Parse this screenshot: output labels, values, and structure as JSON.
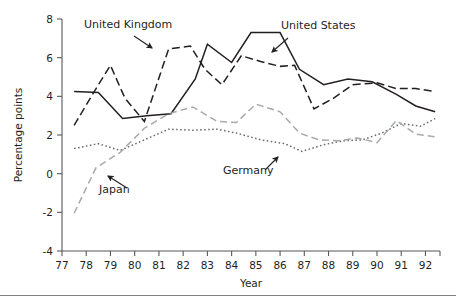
{
  "chart_data": {
    "type": "line",
    "title": "",
    "xlabel": "Year",
    "ylabel": "Percentage points",
    "xlim": [
      77,
      92.6
    ],
    "ylim": [
      -4,
      8
    ],
    "grid": false,
    "legend_position": "inline-annotations",
    "xticks": [
      "77",
      "78",
      "79",
      "80",
      "81",
      "82",
      "83",
      "84",
      "85",
      "86",
      "87",
      "88",
      "89",
      "90",
      "91",
      "92"
    ],
    "yticks": [
      "-4",
      "-2",
      "0",
      "2",
      "4",
      "6",
      "8"
    ],
    "x": [
      77.5,
      78,
      79,
      80,
      81,
      82,
      82.5,
      83,
      84,
      85,
      86,
      86.5,
      87,
      88,
      89,
      90,
      91,
      92,
      92.5
    ],
    "series": [
      {
        "name": "United States",
        "style": "solid",
        "color": "#231f20",
        "x": [
          77.5,
          78.5,
          79.5,
          80.5,
          81.5,
          82.5,
          83.0,
          84.0,
          84.8,
          86.0,
          86.8,
          87.8,
          88.8,
          89.8,
          90.8,
          91.6,
          92.4
        ],
        "values": [
          4.25,
          4.2,
          2.85,
          3.0,
          3.1,
          4.9,
          6.7,
          5.75,
          7.3,
          7.3,
          5.4,
          4.6,
          4.9,
          4.75,
          4.1,
          3.5,
          3.2
        ]
      },
      {
        "name": "United Kingdom",
        "style": "dashed",
        "color": "#231f20",
        "x": [
          77.5,
          78.5,
          79.0,
          79.6,
          80.4,
          81.4,
          82.3,
          82.9,
          83.6,
          84.4,
          85.2,
          86.0,
          86.6,
          87.4,
          88.2,
          89.0,
          90.0,
          90.8,
          91.6,
          92.4
        ],
        "values": [
          2.5,
          4.6,
          5.6,
          3.9,
          2.7,
          6.45,
          6.6,
          5.4,
          4.6,
          6.1,
          5.8,
          5.55,
          5.6,
          3.35,
          3.9,
          4.6,
          4.7,
          4.4,
          4.4,
          4.25
        ]
      },
      {
        "name": "Germany",
        "style": "dotted",
        "color": "#6d6e71",
        "x": [
          77.5,
          78.5,
          79.4,
          80.4,
          81.4,
          82.4,
          83.4,
          84.2,
          85.2,
          86.2,
          86.9,
          87.8,
          88.6,
          89.4,
          90.2,
          91.0,
          91.8,
          92.4
        ],
        "values": [
          1.3,
          1.55,
          1.2,
          1.75,
          2.3,
          2.25,
          2.3,
          2.1,
          1.75,
          1.55,
          1.15,
          1.5,
          1.7,
          1.75,
          2.1,
          2.6,
          2.45,
          2.85
        ]
      },
      {
        "name": "Japan",
        "style": "dashed-light",
        "color": "#a7a9ac",
        "x": [
          77.5,
          78.4,
          79.4,
          80.4,
          81.4,
          82.4,
          83.4,
          84.2,
          85.0,
          86.0,
          86.8,
          87.6,
          88.4,
          89.2,
          90.0,
          90.8,
          91.6,
          92.4
        ],
        "values": [
          -2.05,
          0.3,
          1.1,
          2.35,
          3.1,
          3.45,
          2.7,
          2.65,
          3.6,
          3.2,
          2.1,
          1.75,
          1.7,
          1.85,
          1.6,
          2.75,
          2.05,
          1.9
        ]
      }
    ],
    "annotations": [
      {
        "text": "United Kingdom",
        "label_x": 84,
        "label_y": 28,
        "arrow_x1": 134,
        "arrow_y1": 36,
        "arrow_x2": 152,
        "arrow_y2": 48
      },
      {
        "text": "United States",
        "label_x": 281,
        "label_y": 29,
        "arrow_x1": 288,
        "arrow_y1": 38,
        "arrow_x2": 272,
        "arrow_y2": 52
      },
      {
        "text": "Germany",
        "label_x": 223,
        "label_y": 174,
        "arrow_x1": 265,
        "arrow_y1": 170,
        "arrow_x2": 278,
        "arrow_y2": 157
      },
      {
        "text": "Japan",
        "label_x": 99,
        "label_y": 193,
        "arrow_x1": 127,
        "arrow_y1": 188,
        "arrow_x2": 108,
        "arrow_y2": 176
      }
    ]
  }
}
